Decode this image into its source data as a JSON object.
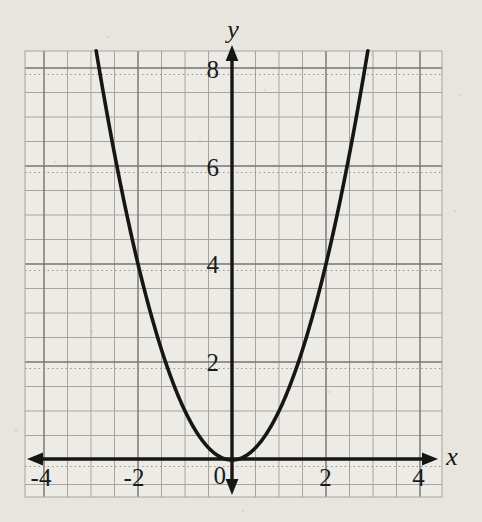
{
  "figure": {
    "x_axis_letter": "x",
    "y_axis_letter": "y",
    "origin_label": "0"
  },
  "chart_data": {
    "type": "line",
    "equation": "y = x^2",
    "series": [
      {
        "name": "y = x^2",
        "coefficients": {
          "a": 1,
          "b": 0,
          "c": 0
        },
        "x_range_drawn": [
          -2.89,
          2.89
        ],
        "points": [
          [
            -2.5,
            6.25
          ],
          [
            -2,
            4
          ],
          [
            -1.5,
            2.25
          ],
          [
            -1,
            1
          ],
          [
            -0.5,
            0.25
          ],
          [
            0,
            0
          ],
          [
            0.5,
            0.25
          ],
          [
            1,
            1
          ],
          [
            1.5,
            2.25
          ],
          [
            2,
            4
          ],
          [
            2.5,
            6.25
          ]
        ]
      }
    ],
    "vertex": [
      0,
      0
    ],
    "xlabel": "x",
    "ylabel": "y",
    "x_ticks": [
      -4,
      -2,
      0,
      2,
      4
    ],
    "y_ticks": [
      2,
      4,
      6,
      8
    ],
    "xlim": [
      -4.4,
      4.47
    ],
    "ylim": [
      -0.76,
      8.35
    ],
    "grid": {
      "show": true,
      "minor_step": 0.5,
      "major_step": 2
    },
    "axis_arrows": "both-ends",
    "legend": "none",
    "theme": {
      "paper": "#e8e5df",
      "grid_fill": "#edebe5",
      "grid_minor": "#a7a49f",
      "grid_major": "#767370",
      "grid_dotted_artifact": "#8d8a85",
      "axis": "#161616",
      "curve": "#161616",
      "text": "#1b1b1b"
    }
  }
}
